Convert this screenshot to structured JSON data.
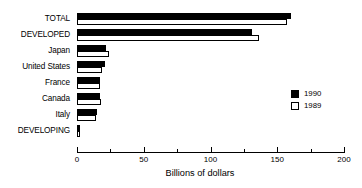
{
  "chart_data": {
    "type": "bar",
    "orientation": "horizontal",
    "title": "",
    "xlabel": "Billions of dollars",
    "ylabel": "",
    "xlim": [
      0,
      200
    ],
    "xticks": [
      0,
      50,
      100,
      150,
      200
    ],
    "xtick_labels": [
      "0",
      "50",
      "100",
      "150",
      "200"
    ],
    "minor_ticks": [
      25,
      75,
      125,
      175
    ],
    "grid": false,
    "legend_position": "right",
    "categories": [
      "TOTAL",
      "DEVELOPED",
      "Japan",
      "United States",
      "France",
      "Canada",
      "Italy",
      "DEVELOPING"
    ],
    "series": [
      {
        "name": "1990",
        "color": "#000000",
        "fill": "solid",
        "values": [
          160,
          131,
          22,
          21,
          17,
          17,
          15,
          2
        ]
      },
      {
        "name": "1989",
        "color": "#ffffff",
        "fill": "open",
        "values": [
          157,
          136,
          24,
          19,
          17,
          18,
          14,
          2
        ]
      }
    ]
  },
  "legend": {
    "entries": [
      {
        "label": "1990",
        "swatch": "filled"
      },
      {
        "label": "1989",
        "swatch": "empty"
      }
    ]
  },
  "colors": {
    "series_1990": "#000000",
    "series_1989": "#ffffff",
    "axis": "#000000",
    "background": "#ffffff"
  }
}
